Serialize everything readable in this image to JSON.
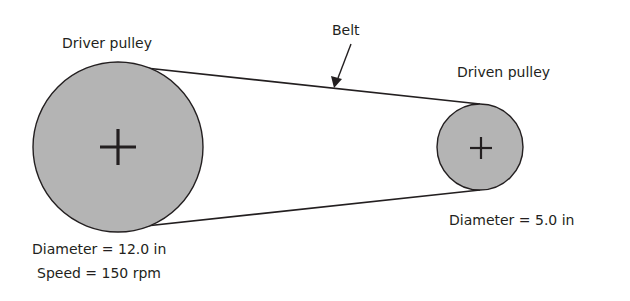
{
  "diagram": {
    "labels": {
      "driver_pulley": "Driver pulley",
      "driven_pulley": "Driven pulley",
      "belt": "Belt",
      "driver_diameter": "Diameter = 12.0 in",
      "driver_speed": "Speed = 150 rpm",
      "driven_diameter": "Diameter = 5.0 in"
    },
    "colors": {
      "pulley_fill": "#b4b4b4",
      "stroke": "#231f20",
      "background": "#ffffff"
    },
    "components": [
      {
        "id": "driver",
        "name": "Driver pulley",
        "diameter_in": 12.0,
        "speed_rpm": 150
      },
      {
        "id": "driven",
        "name": "Driven pulley",
        "diameter_in": 5.0
      },
      {
        "id": "belt",
        "name": "Belt",
        "connects": [
          "driver",
          "driven"
        ]
      }
    ]
  }
}
